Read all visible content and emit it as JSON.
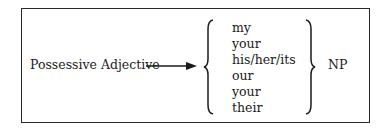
{
  "diagram": {
    "source_label": "Possessive Adjective",
    "arrow": "right-arrow",
    "options": [
      "my",
      "your",
      "his/her/its",
      "our",
      "your",
      "their"
    ],
    "target_label": "NP"
  },
  "colors": {
    "line": "#2a2a2a",
    "text": "#1a1a1a",
    "background": "#ffffff"
  }
}
